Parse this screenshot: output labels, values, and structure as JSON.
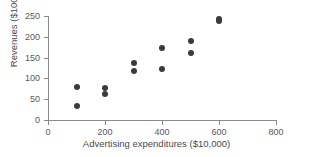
{
  "chart_data": {
    "type": "scatter",
    "title": "",
    "xlabel": "Advertising expenditures ($10,000)",
    "ylabel": "Revenues ($100,000)",
    "xlim": [
      0,
      800
    ],
    "ylim": [
      0,
      250
    ],
    "xticks": [
      0,
      200,
      400,
      600,
      800
    ],
    "yticks": [
      0,
      50,
      100,
      150,
      200,
      250
    ],
    "xtick_labels": [
      "0",
      "200",
      "400",
      "600",
      "800"
    ],
    "ytick_labels": [
      "0",
      "50",
      "100",
      "150",
      "200",
      "250"
    ],
    "grid": false,
    "legend": null,
    "marker": {
      "shape": "circle",
      "color": "#3b3b3f",
      "size": 6
    },
    "points": [
      {
        "x": 100,
        "y": 80
      },
      {
        "x": 100,
        "y": 33
      },
      {
        "x": 200,
        "y": 78
      },
      {
        "x": 200,
        "y": 62
      },
      {
        "x": 300,
        "y": 136
      },
      {
        "x": 300,
        "y": 118
      },
      {
        "x": 400,
        "y": 172
      },
      {
        "x": 400,
        "y": 122
      },
      {
        "x": 500,
        "y": 190
      },
      {
        "x": 500,
        "y": 160
      },
      {
        "x": 600,
        "y": 242
      },
      {
        "x": 600,
        "y": 238
      }
    ]
  }
}
